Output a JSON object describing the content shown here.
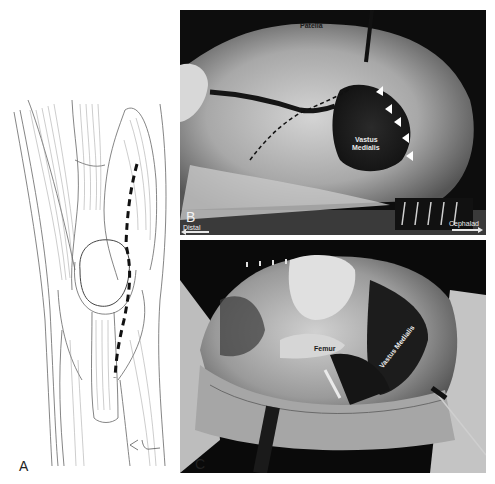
{
  "figure": {
    "panels": [
      {
        "id": "A",
        "type": "illustration",
        "letter": "A",
        "description": "Anterior knee anatomy drawing with dashed medial parapatellar incision line",
        "signature": "signature-mark"
      },
      {
        "id": "B",
        "type": "photograph",
        "letter": "B",
        "labels": {
          "patella": "Patella",
          "vastus_medialis_line1": "Vastus",
          "vastus_medialis_line2": "Medialis"
        },
        "orientation": {
          "left": "Distal",
          "right": "Cephalad"
        },
        "arrowhead_markers": 5
      },
      {
        "id": "C",
        "type": "photograph",
        "letter": "C",
        "labels": {
          "femur": "Femur",
          "vastus_medialis": "Vastus Medialis"
        }
      }
    ],
    "colors": {
      "background": "#ffffff",
      "line_art": "#555555",
      "incision_dash": "#111111",
      "photo_dark": "#0d0d0d",
      "label_light": "#e8e8e8",
      "label_dark": "#1a1a1a"
    }
  }
}
